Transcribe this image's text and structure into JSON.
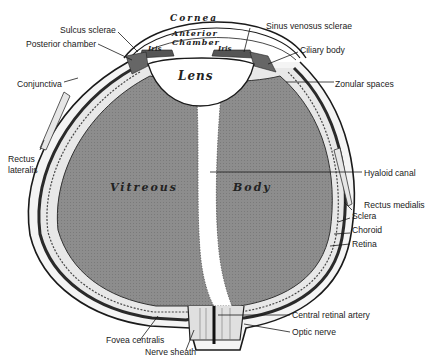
{
  "diagram": {
    "interior_labels": {
      "cornea": "Cornea",
      "anterior": "Anterior",
      "chamber": "Chamber",
      "iris_left": "Iris",
      "iris_right": "Iris",
      "lens": "Lens",
      "vitreous": "Vitreous",
      "body": "Body"
    },
    "callouts_left": [
      {
        "id": "sulcus-sclerae",
        "text": "Sulcus sclerae"
      },
      {
        "id": "posterior-chamber",
        "text": "Posterior chamber"
      },
      {
        "id": "conjunctiva",
        "text": "Conjunctiva"
      },
      {
        "id": "rectus-lateralis-1",
        "text": "Rectus"
      },
      {
        "id": "rectus-lateralis-2",
        "text": "lateralis"
      },
      {
        "id": "fovea-centralis",
        "text": "Fovea centralis"
      },
      {
        "id": "nerve-sheath",
        "text": "Nerve sheath"
      }
    ],
    "callouts_right": [
      {
        "id": "sinus-venosus-sclerae",
        "text": "Sinus venosus sclerae"
      },
      {
        "id": "ciliary-body",
        "text": "Ciliary body"
      },
      {
        "id": "zonular-spaces",
        "text": "Zonular spaces"
      },
      {
        "id": "hyaloid-canal",
        "text": "Hyaloid canal"
      },
      {
        "id": "rectus-medialis",
        "text": "Rectus medialis"
      },
      {
        "id": "sclera",
        "text": "Sclera"
      },
      {
        "id": "choroid",
        "text": "Choroid"
      },
      {
        "id": "retina",
        "text": "Retina"
      },
      {
        "id": "central-retinal-artery",
        "text": "Central retinal artery"
      },
      {
        "id": "optic-nerve",
        "text": "Optic nerve"
      }
    ],
    "colors": {
      "vitreous_fill": "#8f8f8f",
      "wall_dark": "#333333",
      "line": "#1a1a1a",
      "background": "#ffffff"
    }
  }
}
